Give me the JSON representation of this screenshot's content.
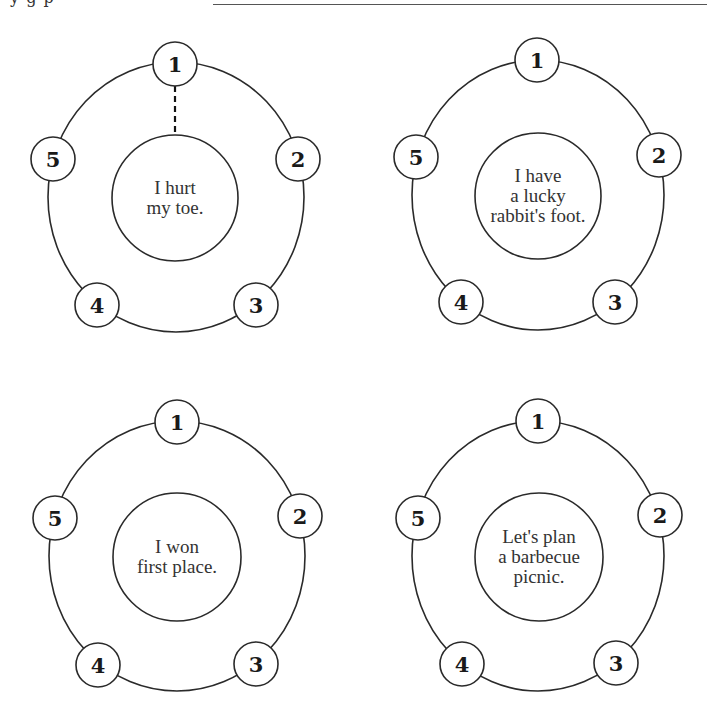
{
  "page": {
    "cropped_header_text": "y  g       p"
  },
  "style": {
    "stroke_color": "#2a2a2a",
    "background": "#ffffff"
  },
  "diagrams": [
    {
      "id": "d1",
      "prompt_lines": [
        "I hurt",
        "my toe."
      ],
      "has_dashed_connector": true,
      "outer": {
        "cx": 176,
        "cy": 197,
        "rx": 128,
        "ry": 135
      },
      "inner": {
        "cx": 175,
        "cy": 198,
        "r": 63
      },
      "badges": [
        {
          "label": "1",
          "x": 175,
          "y": 64
        },
        {
          "label": "2",
          "x": 298,
          "y": 159
        },
        {
          "label": "3",
          "x": 256,
          "y": 305
        },
        {
          "label": "4",
          "x": 97,
          "y": 305
        },
        {
          "label": "5",
          "x": 53,
          "y": 159
        }
      ]
    },
    {
      "id": "d2",
      "prompt_lines": [
        "I have",
        "a lucky",
        "rabbit's foot."
      ],
      "has_dashed_connector": false,
      "outer": {
        "cx": 538,
        "cy": 195,
        "rx": 126,
        "ry": 135
      },
      "inner": {
        "cx": 538,
        "cy": 196,
        "r": 63
      },
      "badges": [
        {
          "label": "1",
          "x": 537,
          "y": 60
        },
        {
          "label": "2",
          "x": 659,
          "y": 155
        },
        {
          "label": "3",
          "x": 615,
          "y": 302
        },
        {
          "label": "4",
          "x": 461,
          "y": 302
        },
        {
          "label": "5",
          "x": 416,
          "y": 157
        }
      ]
    },
    {
      "id": "d3",
      "prompt_lines": [
        "I won",
        "first place."
      ],
      "has_dashed_connector": false,
      "outer": {
        "cx": 177,
        "cy": 556,
        "rx": 128,
        "ry": 135
      },
      "inner": {
        "cx": 177,
        "cy": 557,
        "r": 64
      },
      "badges": [
        {
          "label": "1",
          "x": 177,
          "y": 422
        },
        {
          "label": "2",
          "x": 300,
          "y": 516
        },
        {
          "label": "3",
          "x": 256,
          "y": 664
        },
        {
          "label": "4",
          "x": 98,
          "y": 665
        },
        {
          "label": "5",
          "x": 55,
          "y": 518
        }
      ]
    },
    {
      "id": "d4",
      "prompt_lines": [
        "Let's plan",
        "a barbecue",
        "picnic."
      ],
      "has_dashed_connector": false,
      "outer": {
        "cx": 538,
        "cy": 556,
        "rx": 126,
        "ry": 135
      },
      "inner": {
        "cx": 539,
        "cy": 557,
        "r": 64
      },
      "badges": [
        {
          "label": "1",
          "x": 538,
          "y": 421
        },
        {
          "label": "2",
          "x": 660,
          "y": 515
        },
        {
          "label": "3",
          "x": 616,
          "y": 663
        },
        {
          "label": "4",
          "x": 462,
          "y": 664
        },
        {
          "label": "5",
          "x": 418,
          "y": 518
        }
      ]
    }
  ]
}
